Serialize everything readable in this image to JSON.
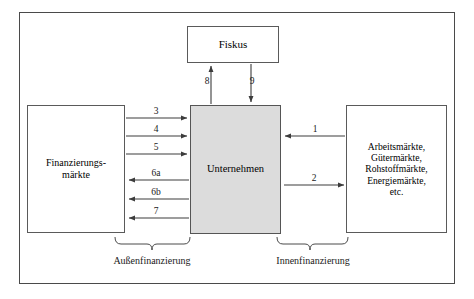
{
  "diagram": {
    "boxes": {
      "fiskus": {
        "label": "Fiskus"
      },
      "finanzierungsmaerkte": {
        "label": "Finanzierungs-\nmärkte"
      },
      "unternehmen": {
        "label": "Unternehmen",
        "fill": "#dcdcdc"
      },
      "maerkte": {
        "label": "Arbeitsmärkte,\nGütermärkte,\nRohstoffmärkte,\nEnergiemärkte,\netc."
      }
    },
    "flows": [
      {
        "id": "1",
        "label": "1",
        "direction": "left",
        "from": "maerkte",
        "to": "unternehmen"
      },
      {
        "id": "2",
        "label": "2",
        "direction": "right",
        "from": "unternehmen",
        "to": "maerkte"
      },
      {
        "id": "3",
        "label": "3",
        "direction": "right",
        "from": "finanzierungsmaerkte",
        "to": "unternehmen"
      },
      {
        "id": "4",
        "label": "4",
        "direction": "right",
        "from": "finanzierungsmaerkte",
        "to": "unternehmen"
      },
      {
        "id": "5",
        "label": "5",
        "direction": "right",
        "from": "finanzierungsmaerkte",
        "to": "unternehmen"
      },
      {
        "id": "6a",
        "label": "6a",
        "direction": "left",
        "from": "unternehmen",
        "to": "finanzierungsmaerkte"
      },
      {
        "id": "6b",
        "label": "6b",
        "direction": "left",
        "from": "unternehmen",
        "to": "finanzierungsmaerkte"
      },
      {
        "id": "7",
        "label": "7",
        "direction": "left",
        "from": "unternehmen",
        "to": "finanzierungsmaerkte"
      },
      {
        "id": "8",
        "label": "8",
        "direction": "up",
        "from": "unternehmen",
        "to": "fiskus"
      },
      {
        "id": "9",
        "label": "9",
        "direction": "down",
        "from": "fiskus",
        "to": "unternehmen"
      }
    ],
    "groups": [
      {
        "id": "aussen",
        "label": "Außenfinanzierung"
      },
      {
        "id": "innen",
        "label": "Innenfinanzierung"
      }
    ],
    "colors": {
      "frame": "#4a4a4a",
      "box_border": "#5a5a5a",
      "unternehmen_fill": "#dcdcdc",
      "arrow": "#3c3c3c",
      "text": "#1a1a1a",
      "background": "#ffffff"
    }
  }
}
